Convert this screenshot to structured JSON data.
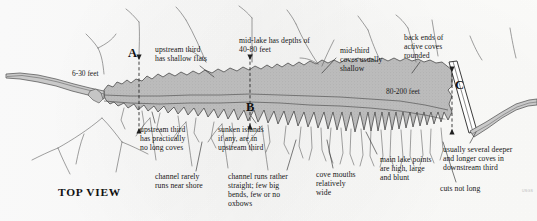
{
  "figure": {
    "view_title": "TOP VIEW",
    "credit": "USGS",
    "type": "reservoir-top-view-diagram",
    "colors": {
      "water_fill": "#b9b9b9",
      "water_stroke": "#4a4a4a",
      "creek_stroke": "#5a5a5a",
      "text": "#171717",
      "paper": "#fefefe",
      "dam_fill": "#ffffff"
    }
  },
  "section_markers": [
    {
      "letter": "A",
      "x": 128,
      "y": 47,
      "line_x": 139,
      "line_top": 56,
      "line_bottom": 132
    },
    {
      "letter": "B",
      "x": 246,
      "y": 101,
      "line_x": 250,
      "line_top": 56,
      "line_bottom": 128
    },
    {
      "letter": "C",
      "x": 455,
      "y": 79,
      "line_x": 452,
      "line_top": 68,
      "line_bottom": 133
    }
  ],
  "depth_labels": [
    {
      "id": "upstream-depth",
      "text": "6-30 feet",
      "x": 72,
      "y": 70
    },
    {
      "id": "downstream-depth",
      "text": "80-200 feet",
      "x": 386,
      "y": 88
    }
  ],
  "annotations": [
    {
      "id": "upstream-shallow-flats",
      "text": "upstream third\nhas shallow flats",
      "x": 155,
      "y": 45,
      "align": "left",
      "leader": {
        "x1": 200,
        "y1": 66,
        "x2": 214,
        "y2": 77
      }
    },
    {
      "id": "mid-lake-depths",
      "text": "mid-lake has depths of\n40-80 feet",
      "x": 239,
      "y": 36,
      "align": "left",
      "leader": {
        "x1": 252,
        "y1": 54,
        "x2": 252,
        "y2": 62
      }
    },
    {
      "id": "mid-third-coves-shallow",
      "text": "mid-third\ncoves usually\nshallow",
      "x": 340,
      "y": 46,
      "align": "left",
      "leader": {
        "x1": 336,
        "y1": 58,
        "x2": 322,
        "y2": 73
      }
    },
    {
      "id": "back-ends-rounded",
      "text": "back ends of\nactive coves\nrounded",
      "x": 404,
      "y": 33,
      "align": "left",
      "leader": {
        "x1": 420,
        "y1": 62,
        "x2": 412,
        "y2": 73
      }
    },
    {
      "id": "upstream-no-long-coves",
      "text": "upstream third\nhas practically\nno long coves",
      "x": 140,
      "y": 125,
      "align": "left",
      "leader": {
        "x1": 155,
        "y1": 123,
        "x2": 152,
        "y2": 112
      }
    },
    {
      "id": "sunken-islands",
      "text": "sunken islands\nif any, are in\nupstream third",
      "x": 218,
      "y": 125,
      "align": "left",
      "leader": {
        "x1": 256,
        "y1": 123,
        "x2": 251,
        "y2": 116
      }
    },
    {
      "id": "channel-near-shore",
      "text": "channel rarely\nruns near shore",
      "x": 155,
      "y": 172,
      "align": "left",
      "leader": {
        "x1": 196,
        "y1": 171,
        "x2": 202,
        "y2": 142
      }
    },
    {
      "id": "channel-straight",
      "text": "channel runs rather\nstraight; few big\nbends, few or no\noxbows",
      "x": 228,
      "y": 172,
      "align": "left",
      "leader": {
        "x1": 287,
        "y1": 170,
        "x2": 296,
        "y2": 140
      }
    },
    {
      "id": "cove-mouths-wide",
      "text": "cove mouths\nrelatively\nwide",
      "x": 316,
      "y": 170,
      "align": "left",
      "leader": {
        "x1": 333,
        "y1": 168,
        "x2": 327,
        "y2": 140
      }
    },
    {
      "id": "main-lake-points",
      "text": "main lake points\nare high, large\nand blunt",
      "x": 380,
      "y": 155,
      "align": "left",
      "leader": {
        "x1": 377,
        "y1": 154,
        "x2": 366,
        "y2": 132
      }
    },
    {
      "id": "cuts-not-long",
      "text": "cuts not long",
      "x": 440,
      "y": 184,
      "align": "left",
      "leader": {
        "x1": 456,
        "y1": 182,
        "x2": 443,
        "y2": 142
      }
    },
    {
      "id": "downstream-deeper-coves",
      "text": "usually several deeper\nand longer coves in\ndownstream third",
      "x": 443,
      "y": 145,
      "align": "left",
      "leader": {
        "x1": 470,
        "y1": 143,
        "x2": 476,
        "y2": 132
      }
    }
  ],
  "chart_data": {
    "type": "diagram",
    "title": "TOP VIEW",
    "zones": [
      {
        "name": "upstream third",
        "depth_range_feet": [
          6,
          30
        ],
        "traits": [
          "shallow flats",
          "practically no long coves",
          "sunken islands if any"
        ]
      },
      {
        "name": "mid third",
        "depth_range_feet": [
          40,
          80
        ],
        "traits": [
          "coves usually shallow",
          "cove mouths relatively wide"
        ]
      },
      {
        "name": "downstream third",
        "depth_range_feet": [
          80,
          200
        ],
        "traits": [
          "back ends of active coves rounded",
          "main lake points high, large and blunt",
          "several deeper and longer coves",
          "cuts not long"
        ]
      }
    ],
    "cross_sections": [
      "A",
      "B",
      "C"
    ]
  }
}
